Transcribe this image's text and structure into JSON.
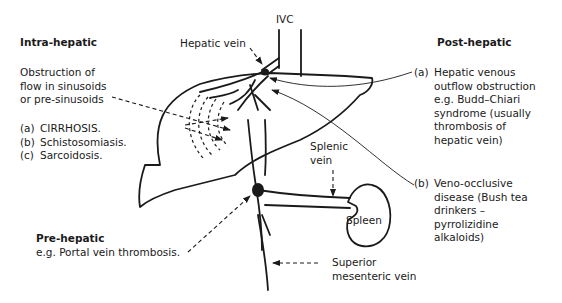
{
  "labels": {
    "ivc": "IVC",
    "hepatic_vein": "Hepatic vein",
    "splenic_vein": [
      "Splenic",
      "vein"
    ],
    "spleen": "Spleen",
    "superior_mesenteric_vein": [
      "Superior",
      "mesenteric vein"
    ]
  },
  "intra_hepatic": {
    "heading": "Intra-hepatic",
    "description": [
      "Obstruction of",
      "flow in sinusoids",
      "or pre-sinusoids"
    ],
    "items": [
      {
        "num": "(a)",
        "text": "CIRRHOSIS."
      },
      {
        "num": "(b)",
        "text": "Schistosomiasis."
      },
      {
        "num": "(c)",
        "text": "Sarcoidosis."
      }
    ]
  },
  "pre_hepatic": {
    "heading": "Pre-hepatic",
    "text": "e.g. Portal vein thrombosis."
  },
  "post_hepatic": {
    "heading": "Post-hepatic",
    "items": [
      {
        "num": "(a)",
        "lines": [
          "Hepatic venous",
          "outflow obstruction",
          "e.g. Budd–Chiari",
          "syndrome (usually",
          "thrombosis of",
          "hepatic vein)"
        ]
      },
      {
        "num": "(b)",
        "lines": [
          "Veno-occlusive",
          "disease (Bush tea",
          "drinkers –",
          "pyrrolizidine",
          "alkaloids)"
        ]
      }
    ]
  },
  "colors": {
    "ink": "#1a1a1a",
    "background": "#ffffff"
  }
}
